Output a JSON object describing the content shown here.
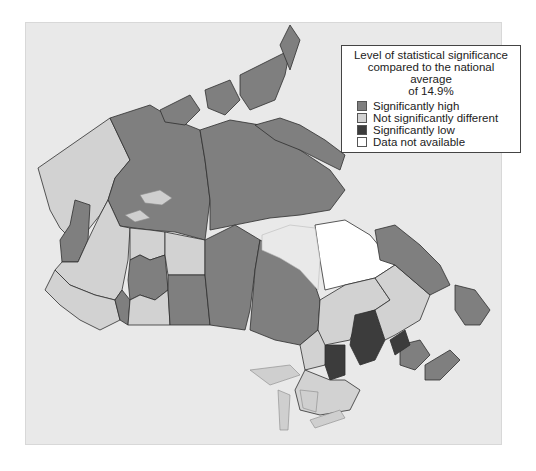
{
  "map": {
    "subject": "Canada health regions",
    "legend": {
      "title_line1": "Level of statistical significance",
      "title_line2": "compared to the national average",
      "title_line3": "of 14.9%",
      "national_average": "14.9%",
      "items": [
        {
          "label": "Significantly high",
          "color": "#7f7f7f"
        },
        {
          "label": "Not significantly different",
          "color": "#d2d2d2"
        },
        {
          "label": "Significantly low",
          "color": "#3c3c3c"
        },
        {
          "label": "Data not available",
          "color": "#ffffff"
        }
      ]
    },
    "colors": {
      "background": "#e9e9e9",
      "water": "#e9e9e9",
      "lakes": "#cfcfcf",
      "border": "#2f2f2f",
      "high": "#7f7f7f",
      "not_different": "#d2d2d2",
      "low": "#3c3c3c",
      "na": "#ffffff"
    }
  }
}
